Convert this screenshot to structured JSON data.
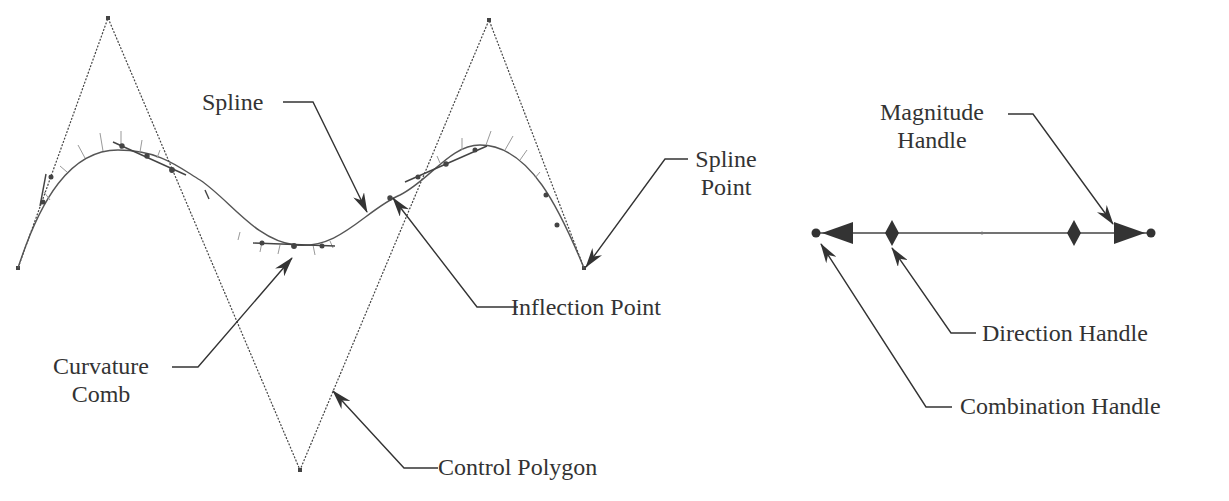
{
  "diagram": {
    "colors": {
      "ink": "#333333",
      "curve": "#555555",
      "comb": "#888888",
      "background": "#ffffff"
    },
    "labels": {
      "spline": "Spline",
      "spline_point_line1": "Spline",
      "spline_point_line2": "Point",
      "inflection_point": "Inflection Point",
      "curvature_comb_line1": "Curvature",
      "curvature_comb_line2": "Comb",
      "control_polygon": "Control Polygon",
      "magnitude_handle_line1": "Magnitude",
      "magnitude_handle_line2": "Handle",
      "direction_handle": "Direction Handle",
      "combination_handle": "Combination Handle"
    },
    "control_polygon_points": [
      [
        18,
        268
      ],
      [
        108,
        18
      ],
      [
        300,
        470
      ],
      [
        489,
        20
      ],
      [
        584,
        268
      ]
    ],
    "handle": {
      "start": [
        816,
        233
      ],
      "end": [
        1151,
        233
      ],
      "midpoint": [
        982,
        233
      ]
    }
  }
}
